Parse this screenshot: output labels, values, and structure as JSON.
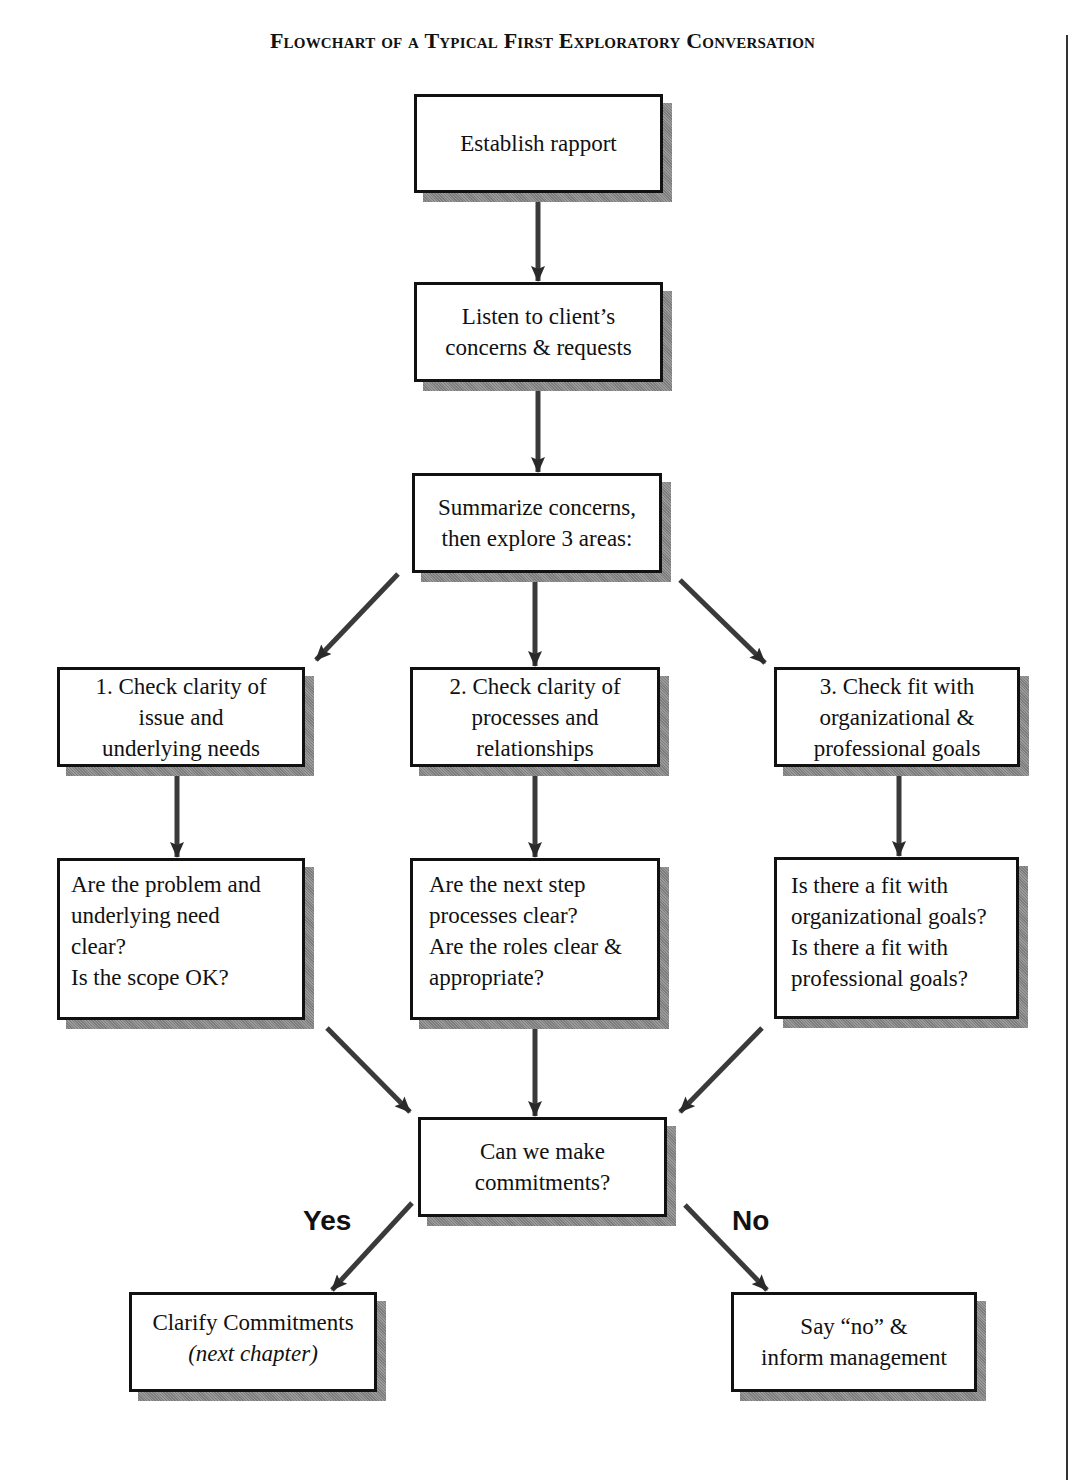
{
  "title": "Flowchart of a Typical First Exploratory Conversation",
  "nodes": {
    "establish": {
      "lines": [
        "Establish rapport"
      ]
    },
    "listen": {
      "lines": [
        "Listen to client’s",
        "concerns & requests"
      ]
    },
    "summarize": {
      "lines": [
        "Summarize concerns,",
        "then explore 3 areas:"
      ]
    },
    "check1": {
      "lines": [
        "1. Check clarity of",
        "issue and",
        "underlying needs"
      ]
    },
    "check2": {
      "lines": [
        "2. Check clarity of",
        "processes and",
        "relationships"
      ]
    },
    "check3": {
      "lines": [
        "3. Check fit with",
        "organizational &",
        "professional goals"
      ]
    },
    "question1": {
      "lines": [
        "Are the problem and",
        "underlying need",
        "clear?",
        "Is the scope OK?"
      ]
    },
    "question2": {
      "lines": [
        "Are the next step",
        "processes clear?",
        "Are the roles clear &",
        "appropriate?"
      ]
    },
    "question3": {
      "lines": [
        "Is there a fit with",
        "organizational goals?",
        "Is there a fit with",
        "professional goals?"
      ]
    },
    "decision": {
      "lines": [
        "Can we make",
        "commitments?"
      ]
    },
    "clarify": {
      "lines": [
        "Clarify Commitments",
        "(next chapter)"
      ]
    },
    "decline": {
      "lines": [
        "Say “no” &",
        "inform management"
      ]
    }
  },
  "edge_labels": {
    "yes": "Yes",
    "no": "No"
  },
  "edges": [
    {
      "from": "establish",
      "to": "listen"
    },
    {
      "from": "listen",
      "to": "summarize"
    },
    {
      "from": "summarize",
      "to": "check1"
    },
    {
      "from": "summarize",
      "to": "check2"
    },
    {
      "from": "summarize",
      "to": "check3"
    },
    {
      "from": "check1",
      "to": "question1"
    },
    {
      "from": "check2",
      "to": "question2"
    },
    {
      "from": "check3",
      "to": "question3"
    },
    {
      "from": "question1",
      "to": "decision"
    },
    {
      "from": "question2",
      "to": "decision"
    },
    {
      "from": "question3",
      "to": "decision"
    },
    {
      "from": "decision",
      "to": "clarify",
      "label": "Yes"
    },
    {
      "from": "decision",
      "to": "decline",
      "label": "No"
    }
  ],
  "colors": {
    "border": "#111111",
    "shadow": "#8a8a8a",
    "arrow": "#333333"
  }
}
